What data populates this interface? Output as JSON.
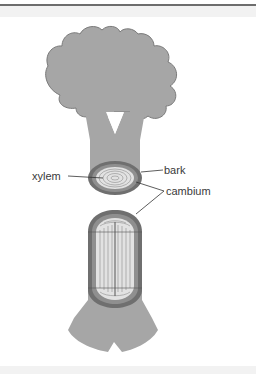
{
  "figure": {
    "labels": {
      "bark": "bark",
      "xylem": "xylem",
      "cambium": "cambium"
    },
    "colors": {
      "tree_fill": "#a6a6a6",
      "tree_outline": "#7a7a7a",
      "bark": "#6f6f6f",
      "cambium": "#8f8f8f",
      "xylem": "#e2e2e2",
      "xylem_lines": "#9a9a9a",
      "leader_lines": "#333333"
    }
  }
}
